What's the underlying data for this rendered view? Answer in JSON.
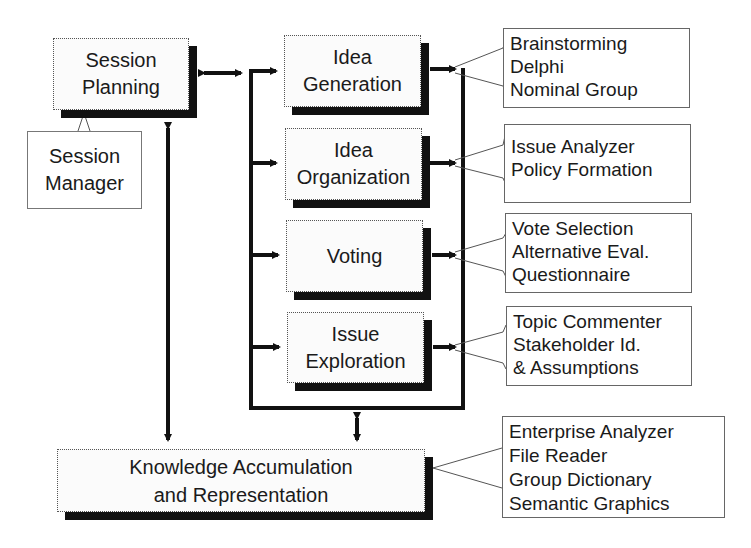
{
  "diagram": {
    "session_planning": {
      "lines": [
        "Session",
        "Planning"
      ]
    },
    "session_manager": {
      "lines": [
        "Session",
        "Manager"
      ]
    },
    "modules": [
      {
        "id": "idea-generation",
        "lines": [
          "Idea",
          "Generation"
        ],
        "tools": [
          "Brainstorming",
          "Delphi",
          "Nominal Group"
        ]
      },
      {
        "id": "idea-organization",
        "lines": [
          "Idea",
          "Organization"
        ],
        "tools": [
          "Issue Analyzer",
          "Policy Formation"
        ]
      },
      {
        "id": "voting",
        "lines": [
          "Voting"
        ],
        "tools": [
          "Vote Selection",
          "Alternative Eval.",
          "Questionnaire"
        ]
      },
      {
        "id": "issue-exploration",
        "lines": [
          "Issue",
          "Exploration"
        ],
        "tools": [
          "Topic Commenter",
          "Stakeholder Id.",
          "& Assumptions"
        ]
      }
    ],
    "knowledge": {
      "lines": [
        "Knowledge Accumulation",
        "and Representation"
      ],
      "tools": [
        "Enterprise Analyzer",
        "File Reader",
        "Group Dictionary",
        "Semantic Graphics"
      ]
    },
    "colors": {
      "line": "#111111",
      "box_fill": "#fbfbfb",
      "shadow": "#111111",
      "background": "#ffffff"
    }
  }
}
